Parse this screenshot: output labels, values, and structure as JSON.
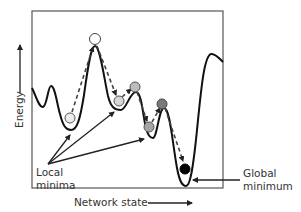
{
  "diagram": {
    "y_axis_label": "Energy",
    "x_axis_label": "Network state",
    "annotations": {
      "local_minima": [
        "Local",
        "minima"
      ],
      "global_minimum": [
        "Global",
        "minimum"
      ]
    },
    "colors": {
      "curve": "#111111",
      "frame": "#555555",
      "arrow": "#333333",
      "ball_white": "#ffffff",
      "ball_light": "#d9d9d9",
      "ball_mid": "#a6a6a6",
      "ball_dark": "#7a7a7a",
      "ball_black": "#000000"
    },
    "balls": [
      {
        "name": "ball-start-peak",
        "x": 95,
        "y": 39,
        "fill": "#ffffff"
      },
      {
        "name": "ball-first-local-min",
        "x": 70,
        "y": 117,
        "fill": "#e8e8e8"
      },
      {
        "name": "ball-second-local-min",
        "x": 119,
        "y": 100,
        "fill": "#d4d4d4"
      },
      {
        "name": "ball-small-peak",
        "x": 135,
        "y": 87,
        "fill": "#bcbcbc"
      },
      {
        "name": "ball-third-local-min",
        "x": 149,
        "y": 127,
        "fill": "#a8a8a8"
      },
      {
        "name": "ball-third-peak",
        "x": 162,
        "y": 104,
        "fill": "#7f7f7f"
      },
      {
        "name": "ball-global-min",
        "x": 185,
        "y": 168,
        "fill": "#000000"
      }
    ]
  }
}
